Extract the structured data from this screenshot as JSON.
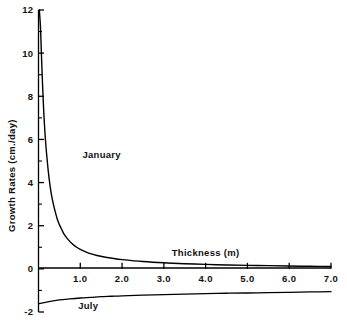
{
  "chart_data": {
    "type": "line",
    "title": "",
    "xlabel": "Thickness (m)",
    "ylabel": "Growth Rates (cm./day)",
    "xlim": [
      0,
      7.0
    ],
    "ylim": [
      -2,
      12
    ],
    "grid": false,
    "legend_position": "inline-annotation",
    "x_ticks": [
      1.0,
      2.0,
      3.0,
      4.0,
      5.0,
      6.0,
      7.0
    ],
    "x_tick_labels": [
      "1.0",
      "2.0",
      "3.0",
      "4.0",
      "5.0",
      "6.0",
      "7.0"
    ],
    "y_ticks": [
      -2,
      0,
      2,
      4,
      6,
      8,
      10,
      12
    ],
    "y_tick_labels": [
      "-2",
      "0",
      "2",
      "4",
      "6",
      "8",
      "10",
      "12"
    ],
    "y_minor_ticks": [
      -1,
      1,
      3,
      5,
      7,
      9,
      11
    ],
    "series": [
      {
        "name": "January",
        "label": "January",
        "color": "#000000",
        "x": [
          0.02,
          0.05,
          0.08,
          0.12,
          0.16,
          0.2,
          0.25,
          0.3,
          0.35,
          0.4,
          0.45,
          0.5,
          0.55,
          0.6,
          0.7,
          0.8,
          0.9,
          1.0,
          1.2,
          1.4,
          1.6,
          1.8,
          2.0,
          2.5,
          3.0,
          3.5,
          4.0,
          4.5,
          5.0,
          5.5,
          6.0,
          6.5,
          7.0
        ],
        "values": [
          12.0,
          11.1,
          9.4,
          7.5,
          6.15,
          5.2,
          4.25,
          3.55,
          3.05,
          2.65,
          2.3,
          2.05,
          1.85,
          1.65,
          1.38,
          1.18,
          1.02,
          0.9,
          0.73,
          0.62,
          0.54,
          0.48,
          0.43,
          0.34,
          0.28,
          0.24,
          0.21,
          0.18,
          0.16,
          0.15,
          0.13,
          0.12,
          0.11
        ]
      },
      {
        "name": "July",
        "label": "July",
        "color": "#000000",
        "x": [
          0.0,
          0.25,
          0.5,
          0.75,
          1.0,
          1.25,
          1.5,
          1.75,
          2.0,
          2.5,
          3.0,
          3.5,
          4.0,
          4.5,
          5.0,
          5.5,
          6.0,
          6.5,
          7.0
        ],
        "values": [
          -1.62,
          -1.52,
          -1.44,
          -1.39,
          -1.35,
          -1.32,
          -1.29,
          -1.27,
          -1.25,
          -1.22,
          -1.19,
          -1.17,
          -1.15,
          -1.13,
          -1.12,
          -1.1,
          -1.09,
          -1.07,
          -1.06
        ]
      }
    ],
    "annotations": [
      {
        "text": "January",
        "x": 1.05,
        "y": 5.15
      },
      {
        "text": "July",
        "x": 0.95,
        "y": -1.85
      },
      {
        "text": "Thickness (m)",
        "x": 4.0,
        "y": 0.62
      }
    ]
  },
  "axes": {
    "x_axis_name": "thickness-axis",
    "y_axis_name": "growth-rate-axis"
  }
}
